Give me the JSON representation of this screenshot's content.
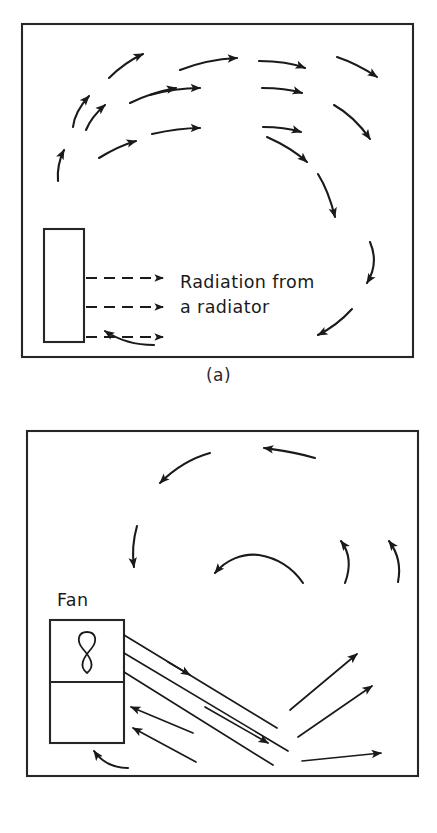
{
  "figure": {
    "background_color": "#ffffff",
    "line_color": "#1a1a1a"
  },
  "panels": [
    {
      "id": "a",
      "caption": "(a)",
      "caption_label": "(a)",
      "annotation_lines": [
        "Radiation from",
        "a radiator"
      ],
      "annotation_line1": "Radiation from",
      "annotation_line2": "a radiator",
      "source_name": "radiator",
      "arrow_style_emitted": "dashed",
      "arrow_style_circulation": "solid-curved",
      "emitted_arrow_count": 3,
      "circulation_description": "clockwise convection loop rising above radiator and descending at far wall"
    },
    {
      "id": "b",
      "caption": "(b)",
      "caption_label": "(b)",
      "source_label": "Fan",
      "source_name": "fan",
      "fan_symbol": "figure-eight-blade",
      "jet_line_count": 3,
      "return_arrow_count": 2,
      "spread_arrow_count": 3,
      "circulation_description": "fan jet directed down-right with recirculation returning to fan inlet"
    }
  ],
  "icons": {
    "fan_blade": "fan-blade-icon",
    "arrow_head": "arrow-head-icon"
  }
}
